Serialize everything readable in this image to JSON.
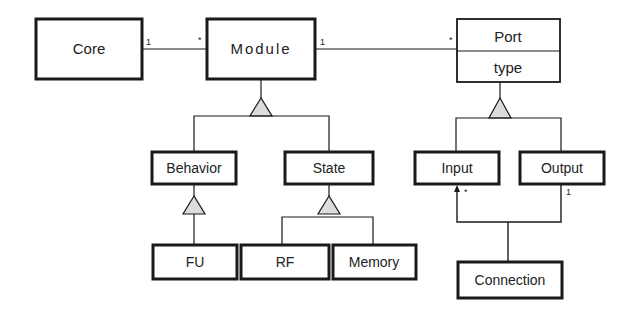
{
  "diagram": {
    "type": "UML class diagram",
    "colors": {
      "line": "#1a1a1a",
      "text": "#222222",
      "triangle_fill": "#dcdcdc",
      "background": "#ffffff"
    },
    "classes": [
      {
        "id": "core",
        "name": "Core"
      },
      {
        "id": "module",
        "name": "Module"
      },
      {
        "id": "port",
        "name": "Port",
        "attributes": [
          "type"
        ]
      },
      {
        "id": "behavior",
        "name": "Behavior"
      },
      {
        "id": "state",
        "name": "State"
      },
      {
        "id": "fu",
        "name": "FU"
      },
      {
        "id": "rf",
        "name": "RF"
      },
      {
        "id": "memory",
        "name": "Memory"
      },
      {
        "id": "input",
        "name": "Input"
      },
      {
        "id": "output",
        "name": "Output"
      },
      {
        "id": "connection",
        "name": "Connection"
      }
    ],
    "associations": [
      {
        "from": "Core",
        "to": "Module",
        "from_mult": "1",
        "to_mult": "*"
      },
      {
        "from": "Module",
        "to": "Port",
        "from_mult": "1",
        "to_mult": "*"
      },
      {
        "from": "Connection",
        "to": "Input",
        "to_mult": "*",
        "navigable": true
      },
      {
        "from": "Connection",
        "to": "Output",
        "to_mult": "1"
      }
    ],
    "generalizations": [
      {
        "parent": "Module",
        "children": [
          "Behavior",
          "State"
        ]
      },
      {
        "parent": "Behavior",
        "children": [
          "FU"
        ]
      },
      {
        "parent": "State",
        "children": [
          "RF",
          "Memory"
        ]
      },
      {
        "parent": "Port",
        "children": [
          "Input",
          "Output"
        ]
      }
    ],
    "labels": {
      "core": "Core",
      "module": "Module",
      "port": "Port",
      "port_attr": "type",
      "behavior": "Behavior",
      "state": "State",
      "fu": "FU",
      "rf": "RF",
      "memory": "Memory",
      "input": "Input",
      "output": "Output",
      "connection": "Connection",
      "mult_core_module_1": "1",
      "mult_core_module_many": "*",
      "mult_module_port_1": "1",
      "mult_module_port_many": "*",
      "mult_input_many": "*",
      "mult_output_1": "1"
    }
  }
}
